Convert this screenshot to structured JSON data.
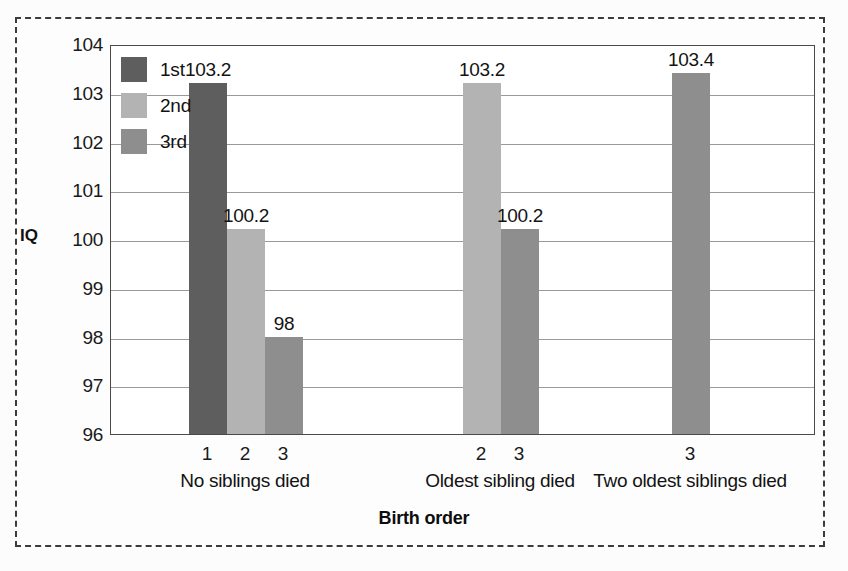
{
  "chart_data": {
    "type": "bar",
    "title": "",
    "xlabel": "Birth order",
    "ylabel": "IQ",
    "ylim": [
      96,
      104
    ],
    "yticks": [
      104,
      103,
      102,
      101,
      100,
      99,
      98,
      97,
      96
    ],
    "grid": true,
    "legend_position": "top-left",
    "legend": [
      "1st",
      "2nd",
      "3rd"
    ],
    "colors": {
      "1st": "#5e5e5e",
      "2nd": "#b3b3b3",
      "3rd": "#8e8e8e"
    },
    "groups": [
      {
        "label": "No siblings died",
        "bars": [
          {
            "tick": "1",
            "series": "1st",
            "value": 103.2,
            "label": "103.2"
          },
          {
            "tick": "2",
            "series": "2nd",
            "value": 100.2,
            "label": "100.2"
          },
          {
            "tick": "3",
            "series": "3rd",
            "value": 98,
            "label": "98"
          }
        ]
      },
      {
        "label": "Oldest sibling died",
        "bars": [
          {
            "tick": "2",
            "series": "2nd",
            "value": 103.2,
            "label": "103.2"
          },
          {
            "tick": "3",
            "series": "3rd",
            "value": 100.2,
            "label": "100.2"
          }
        ]
      },
      {
        "label": "Two oldest siblings died",
        "bars": [
          {
            "tick": "3",
            "series": "3rd",
            "value": 103.4,
            "label": "103.4"
          }
        ]
      }
    ]
  },
  "figure": {
    "border_style": "dashed",
    "border_color": "#3b3b3b"
  }
}
